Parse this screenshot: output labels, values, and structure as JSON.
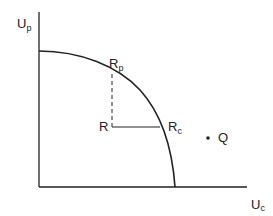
{
  "diagram": {
    "type": "utility-possibility-frontier",
    "axes": {
      "y_label": "U",
      "y_sub": "p",
      "x_label": "U",
      "x_sub": "c"
    },
    "points": {
      "rp": {
        "label": "R",
        "sub": "p"
      },
      "rc": {
        "label": "R",
        "sub": "c"
      },
      "r": {
        "label": "R"
      },
      "q": {
        "label": "Q"
      }
    },
    "colors": {
      "line": "#222222",
      "background": "#ffffff"
    }
  }
}
